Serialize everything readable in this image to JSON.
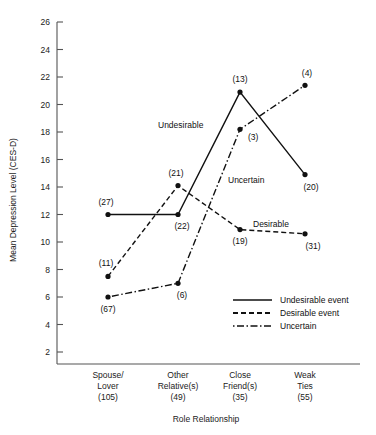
{
  "chart_data": {
    "type": "line",
    "title": "",
    "xlabel": "Role Relationship",
    "ylabel": "Mean Depression Level (CES-D)",
    "ylim": [
      2,
      26
    ],
    "ytick_step": 2,
    "yticks": [
      26,
      24,
      22,
      20,
      18,
      16,
      14,
      12,
      10,
      8,
      6,
      4,
      2
    ],
    "grid": false,
    "legend_position": "bottom-right",
    "categories": [
      "Spouse/\nLover\n(105)",
      "Other\nRelative(s)\n(49)",
      "Close\nFriend(s)\n(35)",
      "Weak\nTies\n(55)"
    ],
    "category_parts": [
      {
        "line1": "Spouse/",
        "line2": "Lover",
        "count": "(105)"
      },
      {
        "line1": "Other",
        "line2": "Relative(s)",
        "count": "(49)"
      },
      {
        "line1": "Close",
        "line2": "Friend(s)",
        "count": "(35)"
      },
      {
        "line1": "Weak",
        "line2": "Ties",
        "count": "(55)"
      }
    ],
    "series": [
      {
        "name": "Undesirable event",
        "inline_label": "Undesirable",
        "style": "solid",
        "values": [
          12.0,
          12.0,
          20.9,
          14.9
        ],
        "point_labels": [
          "(27)",
          "(22)",
          "(13)",
          "(20)"
        ]
      },
      {
        "name": "Desirable event",
        "inline_label": "Desirable",
        "style": "dashed",
        "values": [
          7.5,
          14.1,
          10.9,
          10.6
        ],
        "point_labels": [
          "(11)",
          "(21)",
          "(19)",
          "(31)"
        ]
      },
      {
        "name": "Uncertain",
        "inline_label": "Uncertain",
        "style": "dashdot",
        "values": [
          6.0,
          7.0,
          18.2,
          21.4
        ],
        "point_labels": [
          "(67)",
          "(6)",
          "(3)",
          "(4)"
        ]
      }
    ]
  },
  "axes": {
    "y_title": "Mean Depression Level (CES-D)",
    "x_title": "Role Relationship",
    "tick_26": "26",
    "tick_24": "24",
    "tick_22": "22",
    "tick_20": "20",
    "tick_18": "18",
    "tick_16": "16",
    "tick_14": "14",
    "tick_12": "12",
    "tick_10": "10",
    "tick_8": "8",
    "tick_6": "6",
    "tick_4": "4",
    "tick_2": "2"
  },
  "legend": {
    "items": [
      {
        "label": "Undesirable event",
        "style": "solid"
      },
      {
        "label": "Desirable event",
        "style": "dashed"
      },
      {
        "label": "Uncertain",
        "style": "dashdot"
      }
    ]
  },
  "inline_annotations": {
    "undesirable": "Undesirable",
    "uncertain": "Uncertain",
    "desirable": "Desirable"
  },
  "point_labels": {
    "s0": [
      "(27)",
      "(22)",
      "(13)",
      "(20)"
    ],
    "s1": [
      "(11)",
      "(21)",
      "(19)",
      "(31)"
    ],
    "s2": [
      "(67)",
      "(6)",
      "(3)",
      "(4)"
    ]
  },
  "categories_text": {
    "c0l1": "Spouse/",
    "c0l2": "Lover",
    "c0n": "(105)",
    "c1l1": "Other",
    "c1l2": "Relative(s)",
    "c1n": "(49)",
    "c2l1": "Close",
    "c2l2": "Friend(s)",
    "c2n": "(35)",
    "c3l1": "Weak",
    "c3l2": "Ties",
    "c3n": "(55)"
  },
  "colors": {
    "ink": "#111111",
    "axis": "#555555",
    "background": "#ffffff"
  }
}
